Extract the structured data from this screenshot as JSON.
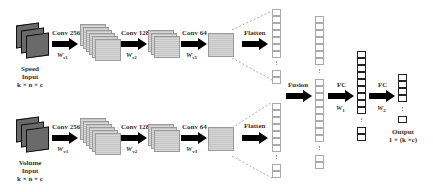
{
  "diagram": {
    "type": "dual-branch CNN architecture",
    "branches": [
      {
        "input": {
          "name": "Speed",
          "label": "Input",
          "shape": "k × n × c"
        },
        "layers": [
          {
            "label": "Conv 256",
            "weight": "W",
            "weight_sub": "s1"
          },
          {
            "label": "Conv 128",
            "weight": "W",
            "weight_sub": "s2"
          },
          {
            "label": "Conv 64",
            "weight": "W",
            "weight_sub": "s3"
          },
          {
            "label": "Flatten"
          }
        ]
      },
      {
        "input": {
          "name": "Volume",
          "label": "Input",
          "shape": "k × n × c"
        },
        "layers": [
          {
            "label": "Conv 256",
            "weight": "W",
            "weight_sub": "v1"
          },
          {
            "label": "Conv 128",
            "weight": "W",
            "weight_sub": "v2"
          },
          {
            "label": "Conv 64",
            "weight": "W",
            "weight_sub": "v3"
          },
          {
            "label": "Flatten"
          }
        ]
      }
    ],
    "fusion": {
      "label": "Fusion"
    },
    "fc1": {
      "label": "FC",
      "weight": "W",
      "weight_sub": "1"
    },
    "fc2": {
      "label": "FC",
      "weight": "W",
      "weight_sub": "2"
    },
    "output": {
      "label": "Output",
      "shape": "1 × (k ×c)"
    },
    "colors": {
      "arrow": "#000000",
      "input_map": "#6a6a6a",
      "feature_map": "#cfcfcf",
      "vector_light": "#aaaaaa",
      "vector_dark": "#222222"
    }
  }
}
